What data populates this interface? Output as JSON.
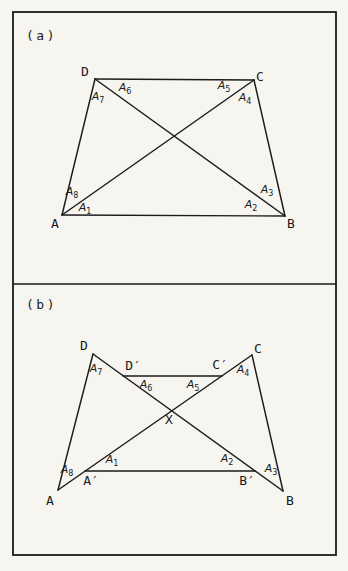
{
  "page": {
    "bg_color": "#f6f5f0",
    "ink_color": "#1b1b1b",
    "frame": {
      "x": 13,
      "y": 12,
      "w": 323,
      "h": 543
    },
    "divider_y": 284
  },
  "figures": [
    {
      "id": "a",
      "panel_label": "(a)",
      "panel_label_pos": {
        "x": 26,
        "y": 35
      },
      "points": {
        "A": [
          62,
          215
        ],
        "B": [
          285,
          216
        ],
        "C": [
          254,
          80
        ],
        "D": [
          95,
          79
        ]
      },
      "edges": [
        {
          "name": "side-AB",
          "from": "A",
          "to": "B"
        },
        {
          "name": "side-BC",
          "from": "B",
          "to": "C"
        },
        {
          "name": "side-CD",
          "from": "C",
          "to": "D"
        },
        {
          "name": "side-DA",
          "from": "D",
          "to": "A"
        },
        {
          "name": "diagonal-AC",
          "from": "A",
          "to": "C"
        },
        {
          "name": "diagonal-DB",
          "from": "D",
          "to": "B"
        }
      ],
      "vertex_labels": [
        {
          "name": "A",
          "text": "A",
          "x": 55,
          "y": 223
        },
        {
          "name": "B",
          "text": "B",
          "x": 291,
          "y": 223
        },
        {
          "name": "C",
          "text": "C",
          "x": 260,
          "y": 76
        },
        {
          "name": "D",
          "text": "D",
          "x": 85,
          "y": 71
        }
      ],
      "angle_labels": [
        {
          "base": "A",
          "sub": "1",
          "x": 85,
          "y": 207
        },
        {
          "base": "A",
          "sub": "2",
          "x": 251,
          "y": 204
        },
        {
          "base": "A",
          "sub": "3",
          "x": 267,
          "y": 189
        },
        {
          "base": "A",
          "sub": "4",
          "x": 245,
          "y": 97
        },
        {
          "base": "A",
          "sub": "5",
          "x": 224,
          "y": 85
        },
        {
          "base": "A",
          "sub": "6",
          "x": 125,
          "y": 87
        },
        {
          "base": "A",
          "sub": "7",
          "x": 98,
          "y": 96
        },
        {
          "base": "A",
          "sub": "8",
          "x": 72,
          "y": 191
        }
      ]
    },
    {
      "id": "b",
      "panel_label": "(b)",
      "panel_label_pos": {
        "x": 26,
        "y": 304
      },
      "points": {
        "A": [
          58,
          490
        ],
        "B": [
          283,
          491
        ],
        "C": [
          252,
          355
        ],
        "D": [
          93,
          354
        ],
        "Ap": [
          85,
          471
        ],
        "Bp": [
          255,
          471
        ],
        "Dp": [
          123,
          376
        ],
        "Cp": [
          222,
          376
        ]
      },
      "edges": [
        {
          "name": "side-DA",
          "from": "D",
          "to": "A"
        },
        {
          "name": "side-CB",
          "from": "C",
          "to": "B"
        },
        {
          "name": "diagonal-AC",
          "from": "A",
          "to": "C"
        },
        {
          "name": "diagonal-DB",
          "from": "D",
          "to": "B"
        },
        {
          "name": "segment-D-prime-C-prime",
          "from": "Dp",
          "to": "Cp"
        },
        {
          "name": "segment-A-prime-B-prime",
          "from": "Ap",
          "to": "Bp"
        }
      ],
      "vertex_labels": [
        {
          "name": "A",
          "text": "A",
          "x": 50,
          "y": 500
        },
        {
          "name": "B",
          "text": "B",
          "x": 290,
          "y": 500
        },
        {
          "name": "C",
          "text": "C",
          "x": 258,
          "y": 348
        },
        {
          "name": "D",
          "text": "D",
          "x": 84,
          "y": 345
        },
        {
          "name": "D-prime",
          "text": "D′",
          "x": 133,
          "y": 365
        },
        {
          "name": "C-prime",
          "text": "C′",
          "x": 220,
          "y": 364
        },
        {
          "name": "A-prime",
          "text": "A′",
          "x": 91,
          "y": 480
        },
        {
          "name": "B-prime",
          "text": "B′",
          "x": 247,
          "y": 480
        },
        {
          "name": "X",
          "text": "X",
          "x": 169,
          "y": 419
        }
      ],
      "angle_labels": [
        {
          "base": "A",
          "sub": "1",
          "x": 112,
          "y": 459
        },
        {
          "base": "A",
          "sub": "2",
          "x": 227,
          "y": 458
        },
        {
          "base": "A",
          "sub": "3",
          "x": 271,
          "y": 468
        },
        {
          "base": "A",
          "sub": "4",
          "x": 243,
          "y": 369
        },
        {
          "base": "A",
          "sub": "5",
          "x": 193,
          "y": 384
        },
        {
          "base": "A",
          "sub": "6",
          "x": 146,
          "y": 384
        },
        {
          "base": "A",
          "sub": "7",
          "x": 96,
          "y": 368
        },
        {
          "base": "A",
          "sub": "8",
          "x": 67,
          "y": 469
        }
      ]
    }
  ]
}
